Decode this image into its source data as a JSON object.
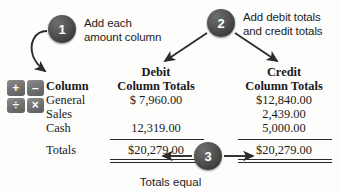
{
  "steps": [
    {
      "number": "1",
      "text_line1": "Add each",
      "text_line2": "amount column"
    },
    {
      "number": "2",
      "text_line1": "Add debit totals",
      "text_line2": "and credit totals"
    },
    {
      "number": "3",
      "caption": "Totals equal"
    }
  ],
  "icons": {
    "calculator": {
      "name": "calculator-icon",
      "keys": [
        "+",
        "–",
        "÷",
        "×"
      ]
    },
    "arrow_step1": "curved-arrow-down-left",
    "arrow_step2_left": "arrow-down-left",
    "arrow_step2_right": "arrow-down-right",
    "arrow_step3_left": "arrow-left",
    "arrow_step3_right": "arrow-right"
  },
  "table": {
    "headers": {
      "label": "Column",
      "debit_line1": "Debit",
      "debit_line2": "Column Totals",
      "credit_line1": "Credit",
      "credit_line2": "Column Totals"
    },
    "rows": [
      {
        "label": "General",
        "debit": "$ 7,960.00",
        "credit": "$12,840.00"
      },
      {
        "label": "Sales",
        "debit": "",
        "credit": "2,439.00"
      },
      {
        "label": "Cash",
        "debit": "12,319.00",
        "credit": "5,000.00"
      }
    ],
    "totals": {
      "label": "Totals",
      "debit": "$20,279.00",
      "credit": "$20,279.00"
    }
  },
  "colors": {
    "badge_dark": "#3a3a3a",
    "badge_text": "#ffffff",
    "key_gray": "#6f6f6f",
    "ink": "#1a1a1a",
    "background": "#fdfdfc"
  }
}
